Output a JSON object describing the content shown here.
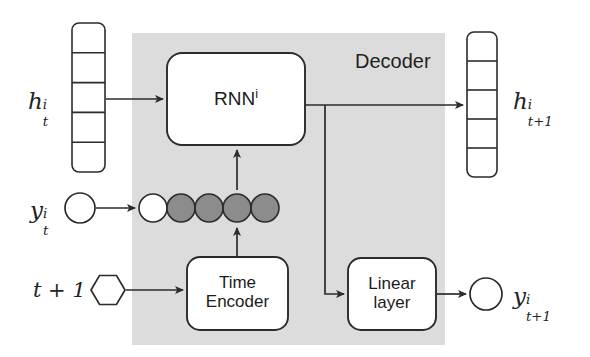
{
  "figure": {
    "type": "neural-network-architecture-diagram",
    "background_color": "#ffffff",
    "region": {
      "label": "Decoder",
      "fill_color": "#dcdcdc",
      "x": 132,
      "y": 33,
      "width": 313,
      "height": 312
    },
    "stroke_color": "#2b2b2b",
    "node_fill_color": "#ffffff",
    "active_circle_color": "#8c8c8c"
  },
  "inputs": {
    "hidden_state_in": {
      "label_base": "h",
      "label_sup": "i",
      "label_sub": "t",
      "cells": 5,
      "x": 72,
      "y": 23,
      "width": 33,
      "height": 149
    },
    "observation_in": {
      "label_base": "y",
      "label_sup": "i",
      "label_sub": "t",
      "shape": "circle"
    },
    "time_index_in": {
      "label": "t + 1",
      "shape": "hexagon"
    }
  },
  "outputs": {
    "hidden_state_out": {
      "label_base": "h",
      "label_sup": "i",
      "label_sub": "t+1",
      "cells": 5,
      "x": 467,
      "y": 32,
      "width": 30,
      "height": 145
    },
    "prediction_out": {
      "label_base": "y",
      "label_sup": "i",
      "label_sub": "t+1",
      "shape": "circle"
    }
  },
  "blocks": [
    {
      "name": "rnn",
      "line1": "RNN",
      "sup": "i",
      "line2": "",
      "x": 167,
      "y": 53,
      "width": 138,
      "height": 92
    },
    {
      "name": "time-encoder",
      "line1": "Time",
      "sup": "",
      "line2": "Encoder",
      "x": 187,
      "y": 257,
      "width": 101,
      "height": 73
    },
    {
      "name": "linear-layer",
      "line1": "Linear",
      "sup": "",
      "line2": "layer",
      "x": 348,
      "y": 258,
      "width": 88,
      "height": 72
    }
  ],
  "embedding_row": {
    "description": "one-hot / embedded observation vector, first unit unfilled, remaining four filled",
    "circle_radius": 14,
    "count": 5,
    "filled_flags": [
      false,
      true,
      true,
      true,
      true
    ],
    "center_y": 208,
    "first_center_x": 153,
    "spacing": 28
  },
  "edges": [
    {
      "name": "hidden-in-to-rnn",
      "from": "hidden_state_in",
      "to": "rnn"
    },
    {
      "name": "observation-in-to-embedding",
      "from": "observation_in",
      "to": "embedding_row"
    },
    {
      "name": "embedding-to-rnn",
      "from": "embedding_row",
      "to": "rnn"
    },
    {
      "name": "time-index-to-time-encoder",
      "from": "time_index_in",
      "to": "time-encoder"
    },
    {
      "name": "time-encoder-to-embedding",
      "from": "time-encoder",
      "to": "embedding_row"
    },
    {
      "name": "rnn-to-hidden-out",
      "from": "rnn",
      "to": "hidden_state_out"
    },
    {
      "name": "rnn-to-linear-layer",
      "from": "rnn",
      "to": "linear-layer"
    },
    {
      "name": "linear-layer-to-prediction",
      "from": "linear-layer",
      "to": "prediction_out"
    }
  ]
}
